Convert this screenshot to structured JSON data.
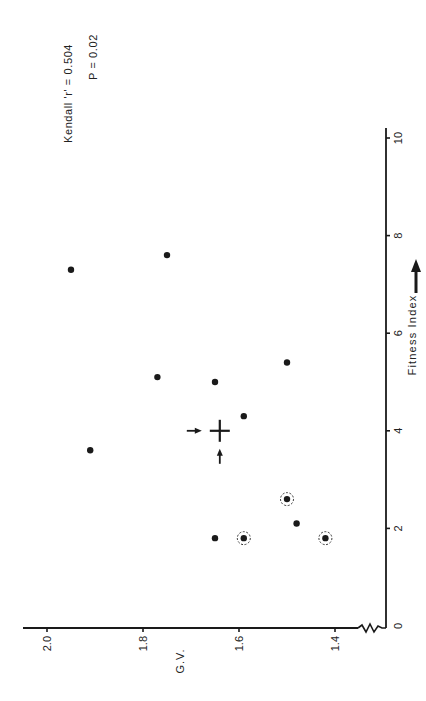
{
  "chart_data": {
    "type": "scatter",
    "orientation": "rotated-90-clockwise",
    "title": "",
    "xlabel": "Fitness Index",
    "ylabel": "G.V.",
    "xlim": [
      0,
      10.5
    ],
    "ylim": [
      1.35,
      2.05
    ],
    "x_ticks": [
      "0",
      "2",
      "4",
      "6",
      "8",
      "10"
    ],
    "y_ticks": [
      "2.0",
      "1.8",
      "1.6",
      "1.4"
    ],
    "y_axis_break": true,
    "grid": false,
    "annotations": {
      "stat_line1": "Kendall 'r' = 0.504",
      "stat_line2": "P = 0.02"
    },
    "points": [
      {
        "x": 7.3,
        "y": 1.95,
        "circled": false
      },
      {
        "x": 7.6,
        "y": 1.75,
        "circled": false
      },
      {
        "x": 3.6,
        "y": 1.91,
        "circled": false
      },
      {
        "x": 5.1,
        "y": 1.77,
        "circled": false
      },
      {
        "x": 5.0,
        "y": 1.65,
        "circled": false
      },
      {
        "x": 5.4,
        "y": 1.5,
        "circled": false
      },
      {
        "x": 4.3,
        "y": 1.59,
        "circled": false
      },
      {
        "x": 1.8,
        "y": 1.65,
        "circled": false
      },
      {
        "x": 1.8,
        "y": 1.59,
        "circled": true
      },
      {
        "x": 2.6,
        "y": 1.5,
        "circled": true
      },
      {
        "x": 2.1,
        "y": 1.48,
        "circled": false
      },
      {
        "x": 1.8,
        "y": 1.42,
        "circled": true
      }
    ],
    "mean_marker": {
      "x": 4.0,
      "y": 1.64,
      "symbol": "cross-with-arrows"
    }
  }
}
